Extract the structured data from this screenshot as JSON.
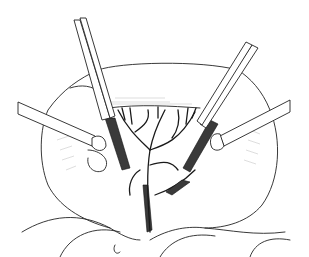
{
  "figure": {
    "elements": {
      "left_forceps": "forceps-icon",
      "right_forceps": "forceps-icon",
      "left_retractor": "retractor-icon",
      "right_retractor": "retractor-icon",
      "vessels": "vessel-tree",
      "bowel": "bowel-loops"
    },
    "colors": {
      "background": "#ffffff",
      "ink": "#222222",
      "dark_fill": "#3a3a3a"
    }
  }
}
